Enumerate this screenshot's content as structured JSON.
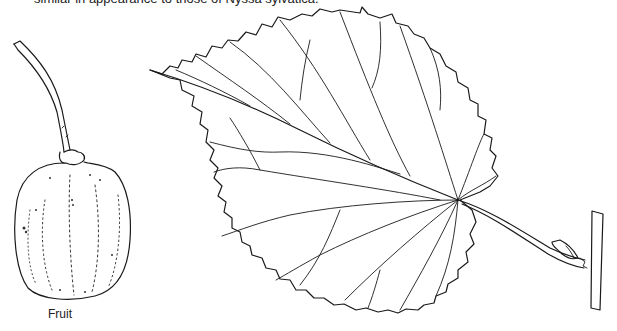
{
  "figure": {
    "caption_top": "similar in appearance to those of Nyssa sylvatica.",
    "labels": {
      "fruit": "Fruit"
    },
    "illustrations": [
      {
        "name": "fruit-drawing",
        "description": "pen-and-ink drawing of a rounded fruit on a long stalk"
      },
      {
        "name": "leaf-drawing",
        "description": "pen-and-ink drawing of a serrated, cordate leaf with pinnate-palmate venation, petiole attached to twig with bud"
      }
    ],
    "colors": {
      "ink": "#1a1a1a",
      "background": "#ffffff"
    }
  }
}
